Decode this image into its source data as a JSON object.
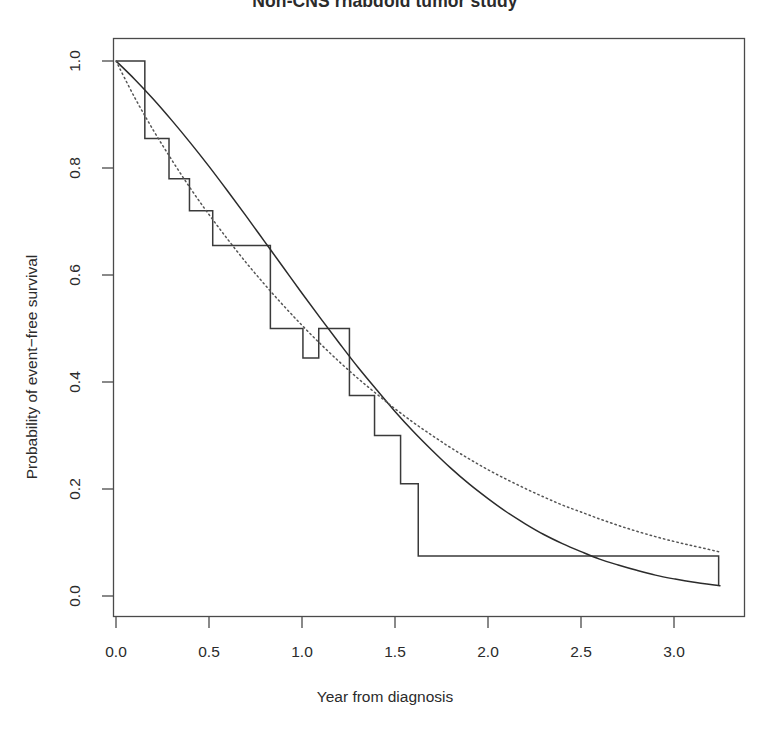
{
  "chart_data": {
    "type": "line",
    "title": "Non-CNS rhabdoid tumor study",
    "subtitle": "",
    "xlabel": "Year from diagnosis",
    "ylabel": "Probability of event−free survival",
    "xlim": [
      0.0,
      3.4
    ],
    "ylim": [
      0.0,
      1.02
    ],
    "xticks": [
      "0.0",
      "0.5",
      "1.0",
      "1.5",
      "2.0",
      "2.5",
      "3.0"
    ],
    "xtick_values": [
      0.0,
      0.5,
      1.0,
      1.5,
      2.0,
      2.5,
      3.0
    ],
    "yticks": [
      "0.0",
      "0.2",
      "0.4",
      "0.6",
      "0.8",
      "1.0"
    ],
    "ytick_values": [
      0.0,
      0.2,
      0.4,
      0.6,
      0.8,
      1.0
    ],
    "grid": false,
    "legend": "none",
    "box": true,
    "series": [
      {
        "name": "Kaplan-Meier event-free survival",
        "style": "step",
        "linestyle": "solid",
        "color": "#3a3a3a",
        "x": [
          0.0,
          0.155,
          0.155,
          0.285,
          0.285,
          0.395,
          0.395,
          0.52,
          0.52,
          0.83,
          0.83,
          1.005,
          1.005,
          1.09,
          1.09,
          1.255,
          1.255,
          1.39,
          1.39,
          1.53,
          1.53,
          1.625,
          1.625,
          3.24,
          3.24
        ],
        "y": [
          1.0,
          1.0,
          0.855,
          0.855,
          0.78,
          0.78,
          0.72,
          0.72,
          0.655,
          0.655,
          0.5,
          0.5,
          0.445,
          0.445,
          0.5,
          0.5,
          0.375,
          0.375,
          0.3,
          0.3,
          0.21,
          0.21,
          0.075,
          0.075,
          0.02
        ]
      },
      {
        "name": "Fitted exponential model",
        "style": "smooth",
        "linestyle": "solid",
        "color": "#2b2b2b",
        "x": [
          0.0,
          0.1,
          0.2,
          0.3,
          0.4,
          0.5,
          0.6,
          0.7,
          0.8,
          0.9,
          1.0,
          1.1,
          1.2,
          1.3,
          1.4,
          1.5,
          1.6,
          1.7,
          1.8,
          1.9,
          2.0,
          2.1,
          2.2,
          2.3,
          2.4,
          2.5,
          2.6,
          2.7,
          2.8,
          2.9,
          3.0,
          3.1,
          3.25
        ],
        "y": [
          1.0,
          0.966,
          0.929,
          0.889,
          0.847,
          0.803,
          0.757,
          0.71,
          0.662,
          0.614,
          0.566,
          0.519,
          0.473,
          0.428,
          0.386,
          0.345,
          0.307,
          0.272,
          0.239,
          0.209,
          0.182,
          0.157,
          0.135,
          0.115,
          0.098,
          0.083,
          0.069,
          0.058,
          0.048,
          0.039,
          0.032,
          0.026,
          0.019
        ]
      },
      {
        "name": "Reference / comparison model",
        "style": "smooth",
        "linestyle": "dotted",
        "color": "#555555",
        "x": [
          0.0,
          0.1,
          0.2,
          0.3,
          0.4,
          0.5,
          0.6,
          0.7,
          0.8,
          0.9,
          1.0,
          1.1,
          1.2,
          1.3,
          1.4,
          1.5,
          1.6,
          1.7,
          1.8,
          1.9,
          2.0,
          2.1,
          2.2,
          2.3,
          2.4,
          2.5,
          2.6,
          2.7,
          2.8,
          2.9,
          3.0,
          3.1,
          3.25
        ],
        "y": [
          1.0,
          0.932,
          0.871,
          0.815,
          0.762,
          0.713,
          0.667,
          0.623,
          0.582,
          0.543,
          0.506,
          0.471,
          0.438,
          0.407,
          0.378,
          0.35,
          0.324,
          0.3,
          0.277,
          0.256,
          0.236,
          0.218,
          0.201,
          0.185,
          0.17,
          0.157,
          0.144,
          0.132,
          0.121,
          0.111,
          0.102,
          0.094,
          0.082
        ]
      }
    ],
    "annotations": []
  },
  "style": {
    "axis_color": "#4a4a4a",
    "text_color": "#2b2b2b",
    "background": "#ffffff"
  }
}
